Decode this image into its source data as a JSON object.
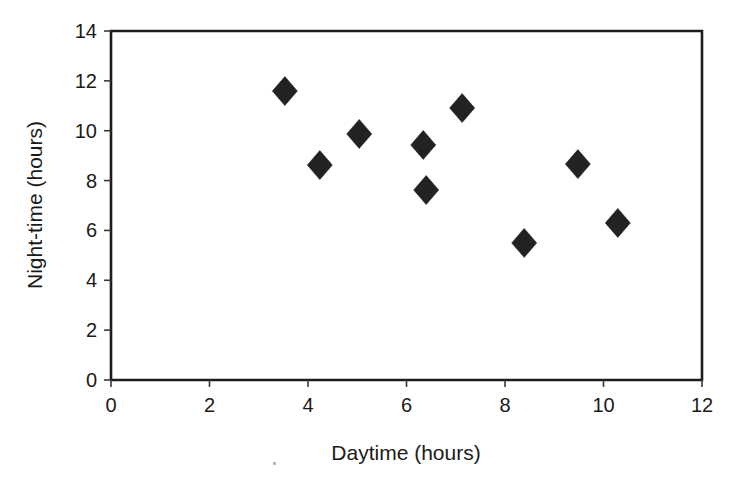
{
  "chart_data": {
    "type": "scatter",
    "title": "",
    "xlabel": "Daytime (hours)",
    "ylabel": "Night-time (hours)",
    "xlim": [
      0,
      12
    ],
    "ylim": [
      0,
      14
    ],
    "xticks": [
      0,
      2,
      4,
      6,
      8,
      10,
      12
    ],
    "yticks": [
      0,
      2,
      4,
      6,
      8,
      10,
      12,
      14
    ],
    "xtick_labels": [
      "0",
      "2",
      "4",
      "6",
      "8",
      "10",
      "12"
    ],
    "ytick_labels": [
      "0",
      "2",
      "4",
      "6",
      "8",
      "10",
      "12",
      "14"
    ],
    "grid": false,
    "legend": false,
    "legend_position": "none",
    "marker_shape": "diamond",
    "marker_color": "#222222",
    "frame_color": "#1d1d1d",
    "background_color": "#ffffff",
    "series": [
      {
        "name": "observations",
        "points": [
          {
            "x": 3.53,
            "y": 11.59
          },
          {
            "x": 4.24,
            "y": 8.62
          },
          {
            "x": 5.04,
            "y": 9.87
          },
          {
            "x": 6.34,
            "y": 9.43
          },
          {
            "x": 6.4,
            "y": 7.62
          },
          {
            "x": 7.13,
            "y": 10.91
          },
          {
            "x": 8.39,
            "y": 5.5
          },
          {
            "x": 9.48,
            "y": 8.66
          },
          {
            "x": 10.29,
            "y": 6.3
          }
        ]
      }
    ]
  },
  "axis": {
    "x_title": "Daytime (hours)",
    "y_title": "Night-time (hours)"
  }
}
